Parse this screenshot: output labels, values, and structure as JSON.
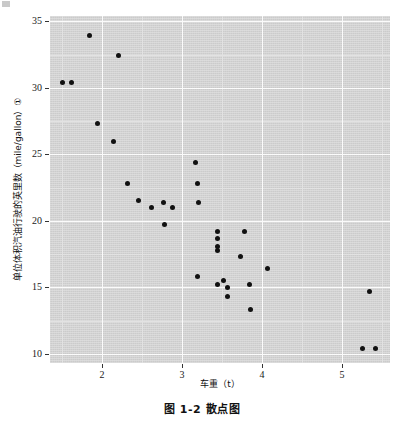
{
  "figure": {
    "caption": "图 1-2  散点图"
  },
  "chart_data": {
    "type": "scatter",
    "title": "",
    "xlabel": "车重（t）",
    "ylabel": "单位体积汽油行驶的英里数（mile/gallon）①",
    "xlim": [
      1.35,
      5.6
    ],
    "ylim": [
      9.3,
      35.4
    ],
    "xticks": [
      2,
      3,
      4,
      5
    ],
    "yticks": [
      10,
      15,
      20,
      25,
      30,
      35
    ],
    "xtick_labels": [
      "2",
      "3",
      "4",
      "5"
    ],
    "ytick_labels": [
      "10",
      "15",
      "20",
      "25",
      "30",
      "35"
    ],
    "grid": true,
    "legend": "none",
    "marker_color": "#111111",
    "panel_color": "#d3d3d3",
    "grid_color": "#fbfbfb",
    "series": [
      {
        "name": "车重 vs 英里数",
        "points": [
          {
            "x": 1.51,
            "y": 30.4
          },
          {
            "x": 1.62,
            "y": 30.4
          },
          {
            "x": 1.84,
            "y": 33.9
          },
          {
            "x": 1.94,
            "y": 27.3
          },
          {
            "x": 2.14,
            "y": 26.0
          },
          {
            "x": 2.2,
            "y": 32.4
          },
          {
            "x": 2.32,
            "y": 22.8
          },
          {
            "x": 2.46,
            "y": 21.5
          },
          {
            "x": 2.62,
            "y": 21.0
          },
          {
            "x": 2.77,
            "y": 21.4
          },
          {
            "x": 2.78,
            "y": 19.7
          },
          {
            "x": 2.88,
            "y": 21.0
          },
          {
            "x": 3.17,
            "y": 24.4
          },
          {
            "x": 3.19,
            "y": 22.8
          },
          {
            "x": 3.21,
            "y": 21.4
          },
          {
            "x": 3.19,
            "y": 15.8
          },
          {
            "x": 3.44,
            "y": 19.2
          },
          {
            "x": 3.44,
            "y": 18.7
          },
          {
            "x": 3.44,
            "y": 18.1
          },
          {
            "x": 3.44,
            "y": 17.8
          },
          {
            "x": 3.44,
            "y": 15.2
          },
          {
            "x": 3.52,
            "y": 15.5
          },
          {
            "x": 3.57,
            "y": 14.3
          },
          {
            "x": 3.57,
            "y": 15.0
          },
          {
            "x": 3.73,
            "y": 17.3
          },
          {
            "x": 3.78,
            "y": 19.2
          },
          {
            "x": 3.84,
            "y": 15.2
          },
          {
            "x": 3.85,
            "y": 13.3
          },
          {
            "x": 4.07,
            "y": 16.4
          },
          {
            "x": 5.25,
            "y": 10.4
          },
          {
            "x": 5.34,
            "y": 14.7
          },
          {
            "x": 5.42,
            "y": 10.4
          }
        ]
      }
    ]
  }
}
